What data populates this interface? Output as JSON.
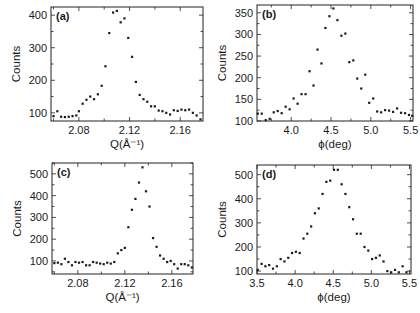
{
  "figure": {
    "background": "#ffffff",
    "ink": "#1a1a1a"
  },
  "chart_data": [
    {
      "id": "a",
      "type": "scatter",
      "panel_label": "(a)",
      "title": "",
      "xlabel": "Q(Å⁻¹)",
      "ylabel": "Counts",
      "xlim": [
        2.058,
        2.178
      ],
      "ylim": [
        75,
        425
      ],
      "xticks": [
        2.08,
        2.12,
        2.16
      ],
      "xtick_labels": [
        "2.08",
        "2.12",
        "2.16"
      ],
      "yticks": [
        100,
        200,
        300,
        400
      ],
      "ytick_labels": [
        "100",
        "200",
        "300",
        "400"
      ],
      "frame": {
        "left": 51,
        "top": 7,
        "right": 203,
        "bottom": 121
      },
      "x": [
        2.06,
        2.063,
        2.066,
        2.069,
        2.072,
        2.075,
        2.078,
        2.08,
        2.083,
        2.086,
        2.089,
        2.092,
        2.095,
        2.098,
        2.101,
        2.104,
        2.107,
        2.11,
        2.113,
        2.116,
        2.119,
        2.122,
        2.125,
        2.128,
        2.131,
        2.134,
        2.137,
        2.14,
        2.143,
        2.146,
        2.149,
        2.152,
        2.155,
        2.158,
        2.161,
        2.164,
        2.167,
        2.17,
        2.173,
        2.176
      ],
      "y": [
        90,
        105,
        88,
        87,
        88,
        90,
        92,
        105,
        128,
        140,
        150,
        142,
        157,
        183,
        243,
        345,
        408,
        413,
        378,
        390,
        330,
        272,
        195,
        155,
        142,
        134,
        120,
        120,
        107,
        105,
        100,
        95,
        108,
        106,
        110,
        108,
        110,
        100,
        92,
        80
      ]
    },
    {
      "id": "b",
      "type": "scatter",
      "panel_label": "(b)",
      "title": "",
      "xlabel": "ϕ(deg)",
      "ylabel": "Counts",
      "xlim": [
        3.57,
        5.53
      ],
      "ylim": [
        100,
        368
      ],
      "xticks": [
        4.0,
        4.5,
        5.0,
        5.5
      ],
      "xtick_labels": [
        "4.0",
        "4.5",
        "5.0",
        "5.5"
      ],
      "yticks": [
        100,
        150,
        200,
        250,
        300,
        350
      ],
      "ytick_labels": [
        "100",
        "150",
        "200",
        "250",
        "300",
        "350"
      ],
      "frame": {
        "left": 257,
        "top": 5,
        "right": 413,
        "bottom": 121
      },
      "x": [
        3.58,
        3.63,
        3.68,
        3.73,
        3.78,
        3.83,
        3.88,
        3.93,
        3.98,
        4.03,
        4.08,
        4.13,
        4.18,
        4.23,
        4.28,
        4.33,
        4.38,
        4.43,
        4.48,
        4.53,
        4.58,
        4.63,
        4.68,
        4.73,
        4.78,
        4.83,
        4.88,
        4.93,
        4.98,
        5.03,
        5.08,
        5.13,
        5.18,
        5.23,
        5.28,
        5.33,
        5.38,
        5.43,
        5.48,
        5.52
      ],
      "y": [
        117,
        117,
        102,
        105,
        120,
        123,
        118,
        133,
        127,
        152,
        140,
        162,
        162,
        215,
        182,
        265,
        233,
        315,
        342,
        360,
        333,
        297,
        302,
        236,
        240,
        198,
        175,
        207,
        142,
        152,
        122,
        120,
        125,
        124,
        121,
        129,
        119,
        118,
        114,
        112
      ]
    },
    {
      "id": "c",
      "type": "scatter",
      "panel_label": "(c)",
      "title": "",
      "xlabel": "Q(Å⁻¹)",
      "ylabel": "Counts",
      "xlim": [
        2.058,
        2.178
      ],
      "ylim": [
        40,
        550
      ],
      "xticks": [
        2.08,
        2.12,
        2.16
      ],
      "xtick_labels": [
        "2.08",
        "2.12",
        "2.16"
      ],
      "yticks": [
        100,
        200,
        300,
        400,
        500
      ],
      "ytick_labels": [
        "100",
        "200",
        "300",
        "400",
        "500"
      ],
      "frame": {
        "left": 52,
        "top": 163,
        "right": 193,
        "bottom": 274
      },
      "x": [
        2.06,
        2.063,
        2.066,
        2.069,
        2.072,
        2.075,
        2.078,
        2.081,
        2.084,
        2.087,
        2.09,
        2.093,
        2.096,
        2.099,
        2.102,
        2.105,
        2.108,
        2.111,
        2.114,
        2.117,
        2.12,
        2.123,
        2.126,
        2.129,
        2.132,
        2.135,
        2.138,
        2.141,
        2.144,
        2.147,
        2.15,
        2.153,
        2.156,
        2.159,
        2.162,
        2.165,
        2.168,
        2.171,
        2.174,
        2.177
      ],
      "y": [
        90,
        92,
        85,
        110,
        95,
        80,
        95,
        92,
        95,
        80,
        80,
        95,
        92,
        88,
        85,
        92,
        88,
        95,
        135,
        150,
        160,
        255,
        335,
        385,
        460,
        530,
        420,
        350,
        205,
        165,
        125,
        110,
        95,
        100,
        85,
        65,
        85,
        85,
        80,
        70
      ]
    },
    {
      "id": "d",
      "type": "scatter",
      "panel_label": "(d)",
      "title": "",
      "xlabel": "ϕ(deg)",
      "ylabel": "Counts",
      "xlim": [
        3.5,
        5.52
      ],
      "ylim": [
        88,
        540
      ],
      "xticks": [
        3.5,
        4.0,
        4.5,
        5.0,
        5.5
      ],
      "xtick_labels": [
        "3.5",
        "4.0",
        "4.5",
        "5.0",
        "5.5"
      ],
      "yticks": [
        100,
        200,
        300,
        400,
        500
      ],
      "ytick_labels": [
        "100",
        "200",
        "300",
        "400",
        "500"
      ],
      "frame": {
        "left": 257,
        "top": 165,
        "right": 411,
        "bottom": 274
      },
      "x": [
        3.51,
        3.56,
        3.61,
        3.66,
        3.71,
        3.76,
        3.81,
        3.86,
        3.91,
        3.96,
        4.01,
        4.06,
        4.11,
        4.16,
        4.21,
        4.26,
        4.31,
        4.36,
        4.41,
        4.46,
        4.51,
        4.56,
        4.61,
        4.66,
        4.71,
        4.76,
        4.81,
        4.86,
        4.91,
        4.96,
        5.01,
        5.06,
        5.11,
        5.16,
        5.21,
        5.26,
        5.31,
        5.36,
        5.41,
        5.46
      ],
      "y": [
        105,
        130,
        120,
        125,
        110,
        120,
        150,
        140,
        155,
        175,
        180,
        175,
        235,
        255,
        285,
        340,
        360,
        420,
        470,
        475,
        520,
        520,
        460,
        420,
        365,
        315,
        255,
        255,
        200,
        185,
        150,
        155,
        165,
        140,
        100,
        95,
        105,
        95,
        120,
        95
      ]
    }
  ]
}
